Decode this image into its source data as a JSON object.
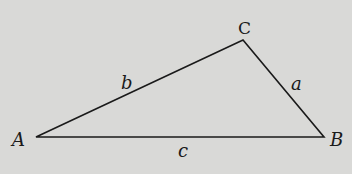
{
  "diagram": {
    "type": "triangle",
    "background": "#d9d9d7",
    "stroke_color": "#1a1a1a",
    "vertices": [
      {
        "id": "A",
        "label": "A",
        "x": 36,
        "y": 137
      },
      {
        "id": "B",
        "label": "B",
        "x": 324,
        "y": 137
      },
      {
        "id": "C",
        "label": "C",
        "x": 243,
        "y": 40
      }
    ],
    "sides": [
      {
        "id": "a",
        "label": "a",
        "from": "B",
        "to": "C"
      },
      {
        "id": "b",
        "label": "b",
        "from": "A",
        "to": "C"
      },
      {
        "id": "c",
        "label": "c",
        "from": "A",
        "to": "B"
      }
    ]
  }
}
